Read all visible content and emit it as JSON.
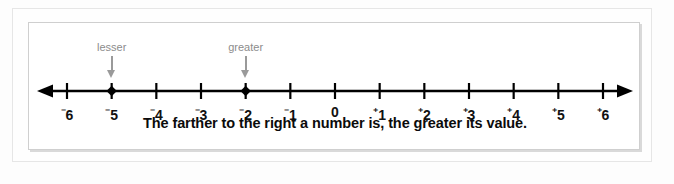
{
  "figure": {
    "caption": "The farther to the right a number is, the greater its value.",
    "line_color": "#000000",
    "annotation_color": "#8c8c8c"
  },
  "annotations": [
    {
      "label": "lesser",
      "at_value": -5,
      "icon": "arrow-down-icon"
    },
    {
      "label": "greater",
      "at_value": -2,
      "icon": "arrow-down-icon"
    }
  ],
  "chart_data": {
    "type": "line",
    "title": "",
    "subtitle": "",
    "xlabel": "",
    "ylabel": "",
    "grid": false,
    "legend": "none",
    "xlim": [
      -6,
      6
    ],
    "axis_style": "number-line-double-arrow",
    "x": [
      -6,
      -5,
      -4,
      -3,
      -2,
      -1,
      0,
      1,
      2,
      3,
      4,
      5,
      6
    ],
    "tick_labels": [
      {
        "value": -6,
        "sign": "⁻",
        "digit": "6"
      },
      {
        "value": -5,
        "sign": "⁻",
        "digit": "5"
      },
      {
        "value": -4,
        "sign": "⁻",
        "digit": "4"
      },
      {
        "value": -3,
        "sign": "⁻",
        "digit": "3"
      },
      {
        "value": -2,
        "sign": "⁻",
        "digit": "2"
      },
      {
        "value": -1,
        "sign": "⁻",
        "digit": "1"
      },
      {
        "value": 0,
        "sign": "",
        "digit": "0"
      },
      {
        "value": 1,
        "sign": "⁺",
        "digit": "1"
      },
      {
        "value": 2,
        "sign": "⁺",
        "digit": "2"
      },
      {
        "value": 3,
        "sign": "⁺",
        "digit": "3"
      },
      {
        "value": 4,
        "sign": "⁺",
        "digit": "4"
      },
      {
        "value": 5,
        "sign": "⁺",
        "digit": "5"
      },
      {
        "value": 6,
        "sign": "⁺",
        "digit": "6"
      }
    ],
    "marked_points": [
      -5,
      -2
    ],
    "marker_shape": "filled-diamond",
    "annotations": [
      "lesser at -5",
      "greater at -2"
    ]
  }
}
